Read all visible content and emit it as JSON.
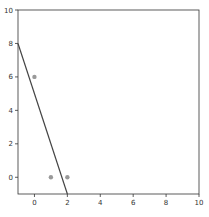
{
  "chart_data": {
    "type": "scatter",
    "title": "",
    "xlabel": "",
    "ylabel": "",
    "xlim": [
      -1,
      10
    ],
    "ylim": [
      -1,
      10
    ],
    "grid": false,
    "xticks": [
      0,
      2,
      4,
      6,
      8,
      10
    ],
    "yticks": [
      0,
      2,
      4,
      6,
      8,
      10
    ],
    "series": [
      {
        "name": "points",
        "type": "scatter",
        "color": "#999999",
        "x": [
          0,
          1,
          2
        ],
        "y": [
          6,
          0,
          0
        ]
      },
      {
        "name": "line",
        "type": "line",
        "color": "#444444",
        "x": [
          -1,
          2
        ],
        "y": [
          8,
          -1
        ]
      }
    ]
  }
}
